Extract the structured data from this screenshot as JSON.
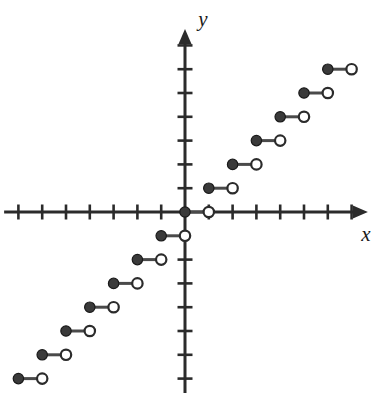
{
  "figure": {
    "title": "",
    "background": "#ffffff",
    "width": 388,
    "height": 413
  },
  "axes": {
    "x_label": "x",
    "y_label": "y",
    "origin_px": {
      "x": 185,
      "y": 212
    },
    "unit_px": 23.8,
    "axis_color": "#2b2b2b",
    "x_axis": {
      "visible": true,
      "arrow_end": "right",
      "tick_values": [
        -7,
        -6,
        -5,
        -4,
        -3,
        -2,
        -1,
        1,
        2,
        3,
        4,
        5,
        6,
        7
      ],
      "tick_labels_shown": false,
      "range": [
        -7.6,
        7.6
      ]
    },
    "y_axis": {
      "visible": true,
      "arrow_end": "up",
      "tick_values": [
        -7,
        -6,
        -5,
        -4,
        -3,
        -2,
        1,
        2,
        3,
        4,
        5,
        6,
        7
      ],
      "tick_labels_shown": false,
      "range": [
        -7.6,
        7.6
      ]
    }
  },
  "chart_data": {
    "type": "line",
    "subtype": "step-function",
    "title": "",
    "xlabel": "x",
    "ylabel": "y",
    "xlim": [
      -7.6,
      7.6
    ],
    "ylim": [
      -7.6,
      7.6
    ],
    "grid": false,
    "legend": false,
    "marker_style": {
      "closed_fill": "#3a3a3a",
      "closed_stroke": "#1a1a1a",
      "open_fill": "#ffffff",
      "open_stroke": "#2b2b2b",
      "segment_color": "#4a4a4a",
      "radius_px": 5.2,
      "segment_width_px": 3
    },
    "segments": [
      {
        "y": 6,
        "x_start": 6,
        "x_end": 7,
        "start_closed": true,
        "end_open": true
      },
      {
        "y": 5,
        "x_start": 5,
        "x_end": 6,
        "start_closed": true,
        "end_open": true
      },
      {
        "y": 4,
        "x_start": 4,
        "x_end": 5,
        "start_closed": true,
        "end_open": true
      },
      {
        "y": 3,
        "x_start": 3,
        "x_end": 4,
        "start_closed": true,
        "end_open": true
      },
      {
        "y": 2,
        "x_start": 2,
        "x_end": 3,
        "start_closed": true,
        "end_open": true
      },
      {
        "y": 1,
        "x_start": 1,
        "x_end": 2,
        "start_closed": true,
        "end_open": true
      },
      {
        "y": 0,
        "x_start": 0,
        "x_end": 1,
        "start_closed": true,
        "end_open": true
      },
      {
        "y": -1,
        "x_start": -1,
        "x_end": 0,
        "start_closed": true,
        "end_open": true
      },
      {
        "y": -2,
        "x_start": -2,
        "x_end": -1,
        "start_closed": true,
        "end_open": true
      },
      {
        "y": -3,
        "x_start": -3,
        "x_end": -2,
        "start_closed": true,
        "end_open": true
      },
      {
        "y": -4,
        "x_start": -4,
        "x_end": -3,
        "start_closed": true,
        "end_open": true
      },
      {
        "y": -5,
        "x_start": -5,
        "x_end": -4,
        "start_closed": true,
        "end_open": true
      },
      {
        "y": -6,
        "x_start": -6,
        "x_end": -5,
        "start_closed": true,
        "end_open": true
      },
      {
        "y": -7,
        "x_start": -7,
        "x_end": -6,
        "start_closed": true,
        "end_open": true
      }
    ]
  }
}
